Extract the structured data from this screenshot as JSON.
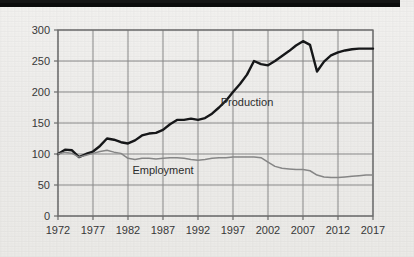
{
  "figure": {
    "background_color": "#f3f2f0",
    "scan_band_color": "#0d0d0d",
    "frame_color": "#6f6f6f",
    "grid_color": "#8c8c8c"
  },
  "labels": {
    "production": "Production",
    "employment": "Employment"
  },
  "chart_data": {
    "type": "line",
    "title": "",
    "subtitle": "",
    "xlabel": "",
    "ylabel": "",
    "xlim": [
      1972,
      2017
    ],
    "ylim": [
      0,
      300
    ],
    "grid": true,
    "legend_position": "inline-annotation",
    "xticks": [
      1972,
      1977,
      1982,
      1987,
      1992,
      1997,
      2002,
      2007,
      2012,
      2017
    ],
    "xtick_labels": [
      "1972",
      "1977",
      "1982",
      "1987",
      "1992",
      "1997",
      "2002",
      "2007",
      "2012",
      "2017"
    ],
    "yticks": [
      0,
      50,
      100,
      150,
      200,
      250,
      300
    ],
    "ytick_labels": [
      "0",
      "50",
      "100",
      "150",
      "200",
      "250",
      "300"
    ],
    "x": [
      1972,
      1973,
      1974,
      1975,
      1976,
      1977,
      1978,
      1979,
      1980,
      1981,
      1982,
      1983,
      1984,
      1985,
      1986,
      1987,
      1988,
      1989,
      1990,
      1991,
      1992,
      1993,
      1994,
      1995,
      1996,
      1997,
      1998,
      1999,
      2000,
      2001,
      2002,
      2003,
      2004,
      2005,
      2006,
      2007,
      2008,
      2009,
      2010,
      2011,
      2012,
      2013,
      2014,
      2015,
      2016,
      2017
    ],
    "series": [
      {
        "name": "Production",
        "color": "#17181a",
        "line_width": 2.4,
        "annotation": "Production",
        "annotation_at": [
          1999,
          178
        ],
        "values": [
          100,
          107,
          106,
          95,
          100,
          104,
          113,
          125,
          123,
          119,
          117,
          122,
          130,
          133,
          134,
          139,
          148,
          155,
          155,
          157,
          155,
          158,
          165,
          175,
          186,
          200,
          213,
          228,
          250,
          245,
          243,
          250,
          258,
          266,
          275,
          282,
          276,
          233,
          249,
          259,
          264,
          267,
          269,
          270,
          270,
          270
        ]
      },
      {
        "name": "Employment",
        "color": "#8a8a8a",
        "line_width": 1.5,
        "annotation": "Employment",
        "annotation_at": [
          1987,
          68
        ],
        "values": [
          100,
          103,
          101,
          95,
          98,
          101,
          104,
          106,
          103,
          101,
          93,
          91,
          93,
          93,
          92,
          93,
          94,
          94,
          93,
          91,
          90,
          91,
          93,
          94,
          94,
          95,
          95,
          95,
          95,
          94,
          87,
          80,
          77,
          76,
          75,
          75,
          73,
          66,
          63,
          62,
          62,
          63,
          64,
          65,
          66,
          66
        ]
      }
    ]
  }
}
